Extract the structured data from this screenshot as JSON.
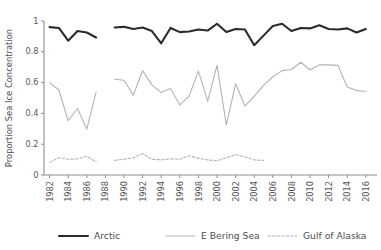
{
  "axes": {
    "ylabel": "Proportion Sea Ice Concentration",
    "xlabel": "",
    "ytick_labels": [
      "0",
      "0.2",
      "0.4",
      "0.6",
      "0.8",
      "1"
    ],
    "ytick_values": [
      0,
      0.2,
      0.4,
      0.6,
      0.8,
      1
    ],
    "xtick_labels": [
      "1982",
      "1984",
      "1986",
      "1988",
      "1990",
      "1992",
      "1994",
      "1996",
      "1998",
      "2000",
      "2002",
      "2004",
      "2006",
      "2008",
      "2010",
      "2012",
      "2014",
      "2016"
    ],
    "xtick_values": [
      1982,
      1984,
      1986,
      1988,
      1990,
      1992,
      1994,
      1996,
      1998,
      2000,
      2002,
      2004,
      2006,
      2008,
      2010,
      2012,
      2014,
      2016
    ]
  },
  "legend": {
    "position": "bottom",
    "entries": [
      {
        "label": "Arctic",
        "color": "#2b2b2b",
        "style": "solid",
        "width": 2.1
      },
      {
        "label": "E Bering Sea",
        "color": "#b3b3b3",
        "style": "solid",
        "width": 1.1
      },
      {
        "label": "Gulf of Alaska",
        "color": "#b3b3b3",
        "style": "dashed",
        "width": 1.1
      }
    ]
  },
  "colors": {
    "arctic": "#2b2b2b",
    "e_bering_sea": "#b3b3b3",
    "gulf_of_alaska": "#b3b3b3",
    "axis": "#8c8c8c",
    "text": "#4d4d4d",
    "background": "#ffffff"
  },
  "chart_data": {
    "type": "line",
    "title": "",
    "xlabel": "",
    "ylabel": "Proportion Sea Ice Concentration",
    "xlim": [
      1981.4,
      2017.2
    ],
    "ylim": [
      0,
      1
    ],
    "grid": false,
    "legend_position": "bottom",
    "x": [
      1982,
      1983,
      1984,
      1985,
      1986,
      1987,
      1989,
      1990,
      1991,
      1992,
      1993,
      1994,
      1995,
      1996,
      1997,
      1998,
      1999,
      2000,
      2001,
      2002,
      2003,
      2004,
      2005,
      2006,
      2007,
      2008,
      2009,
      2010,
      2011,
      2012,
      2013,
      2014,
      2015,
      2016
    ],
    "series": [
      {
        "name": "Arctic",
        "color": "#2b2b2b",
        "style": "solid",
        "values": [
          0.96,
          0.955,
          0.872,
          0.935,
          0.925,
          0.893,
          0.958,
          0.962,
          0.948,
          0.958,
          0.935,
          0.855,
          0.955,
          0.928,
          0.932,
          0.945,
          0.938,
          0.982,
          0.928,
          0.948,
          0.945,
          0.843,
          0.905,
          0.968,
          0.982,
          0.935,
          0.955,
          0.952,
          0.972,
          0.948,
          0.945,
          0.952,
          0.925,
          0.948
        ]
      },
      {
        "name": "E Bering Sea",
        "color": "#b3b3b3",
        "style": "solid",
        "values": [
          0.6,
          0.552,
          0.352,
          0.432,
          0.298,
          0.538,
          0.622,
          0.615,
          0.518,
          0.678,
          0.585,
          0.535,
          0.562,
          0.455,
          0.512,
          0.675,
          0.478,
          0.712,
          0.325,
          0.592,
          0.448,
          0.512,
          0.582,
          0.638,
          0.678,
          0.685,
          0.732,
          0.682,
          0.715,
          0.715,
          0.712,
          0.572,
          0.548,
          0.542
        ]
      },
      {
        "name": "Gulf of Alaska",
        "color": "#b3b3b3",
        "style": "dashed",
        "values": [
          0.082,
          0.112,
          0.102,
          0.105,
          0.122,
          0.085,
          0.095,
          0.102,
          0.112,
          0.138,
          0.102,
          0.098,
          0.105,
          0.102,
          0.125,
          0.108,
          0.098,
          0.092,
          0.112,
          0.132,
          0.118,
          0.098,
          0.095,
          null,
          null,
          null,
          null,
          null,
          null,
          null,
          null,
          null,
          null,
          null
        ]
      }
    ]
  }
}
